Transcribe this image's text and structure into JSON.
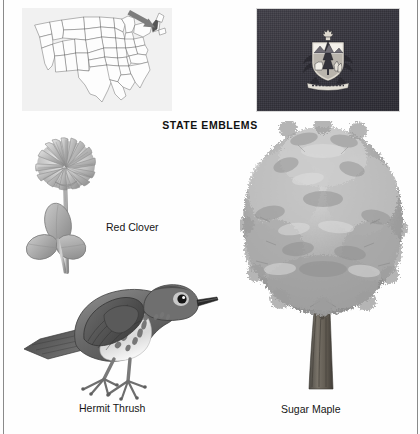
{
  "page": {
    "title": "STATE EMBLEMS",
    "background_color": "#ffffff",
    "border_color": "#8a8a8a"
  },
  "map": {
    "name": "united-states-map",
    "description": "Outline map of the contiguous United States with a gray arrow pointing to the highlighted state of Vermont in New England",
    "highlighted_state": "Vermont",
    "panel_color": "#f1f1f1",
    "outline_color": "#6b6b6b",
    "arrow_color": "#7d7d7d",
    "highlight_color": "#555555"
  },
  "flag": {
    "name": "vermont-state-flag",
    "description": "Vermont state flag: dark blue field charged with the state coat of arms",
    "field_color": "#3a3a42",
    "emblem_color": "#e8e6e0"
  },
  "emblems": [
    {
      "id": "clover",
      "caption": "Red Clover",
      "icon": "clover-flower-illustration",
      "kind": "state-flower"
    },
    {
      "id": "thrush",
      "caption": "Hermit Thrush",
      "icon": "thrush-bird-illustration",
      "kind": "state-bird"
    },
    {
      "id": "maple",
      "caption": "Sugar Maple",
      "icon": "maple-tree-illustration",
      "kind": "state-tree"
    }
  ]
}
